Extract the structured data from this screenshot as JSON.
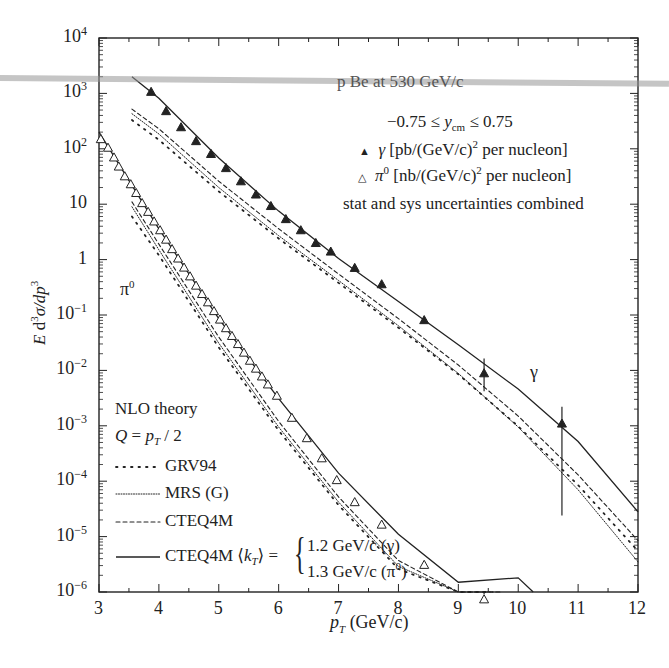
{
  "chart_data": {
    "type": "scatter",
    "title": "p Be at 530 GeV/c",
    "subtitle": "-0.75 ≤ y_cm ≤ 0.75",
    "xlabel": "p_T (GeV/c)",
    "ylabel": "E d³σ/dp³",
    "xlim": [
      3,
      12
    ],
    "ylim": [
      1e-06,
      10000.0
    ],
    "yscale": "log",
    "x_ticks": [
      "3",
      "4",
      "5",
      "6",
      "7",
      "8",
      "9",
      "10",
      "11",
      "12"
    ],
    "y_ticks": [
      "10^-6",
      "10^-5",
      "10^-4",
      "10^-3",
      "10^-2",
      "10^-1",
      "1",
      "10",
      "10^2",
      "10^3",
      "10^4"
    ],
    "grid": false,
    "legend": {
      "data_entries": [
        {
          "marker": "filled-triangle",
          "label": "γ [pb/(GeV/c)² per nucleon]"
        },
        {
          "marker": "open-triangle",
          "label": "π⁰ [nb/(GeV/c)² per nucleon]"
        }
      ],
      "note": "stat and sys uncertainties combined",
      "theory_header": "NLO theory",
      "theory_scale": "Q = p_T / 2",
      "theory_entries": [
        {
          "style": "dotted-sparse",
          "label": "GRV94"
        },
        {
          "style": "dotted-dense",
          "label": "MRS (G)"
        },
        {
          "style": "dashed",
          "label": "CTEQ4M"
        },
        {
          "style": "solid",
          "label": "CTEQ4M ⟨k_T⟩ = {1.2 GeV/c (γ), 1.3 GeV/c (π⁰)}"
        }
      ]
    },
    "annotations": [
      "γ",
      "π⁰"
    ],
    "series": [
      {
        "name": "gamma data",
        "marker": "filled-triangle",
        "x": [
          3.87,
          4.12,
          4.37,
          4.62,
          4.87,
          5.12,
          5.37,
          5.62,
          5.87,
          6.12,
          6.37,
          6.62,
          6.87,
          7.27,
          7.72,
          8.43,
          9.43,
          10.73
        ],
        "y": [
          1070,
          480,
          246,
          138,
          81,
          45,
          26,
          15,
          9.3,
          5.4,
          3.4,
          2.0,
          1.4,
          0.71,
          0.36,
          0.081,
          0.0089,
          0.0011
        ],
        "err_low": [
          null,
          null,
          null,
          null,
          null,
          null,
          null,
          null,
          null,
          null,
          null,
          null,
          null,
          null,
          null,
          null,
          0.0042,
          2.4e-05
        ],
        "err_high": [
          null,
          null,
          null,
          null,
          null,
          null,
          null,
          null,
          null,
          null,
          null,
          null,
          null,
          null,
          null,
          null,
          0.0164,
          0.0022
        ]
      },
      {
        "name": "pi0 data",
        "marker": "open-triangle",
        "x": [
          3.03,
          3.15,
          3.25,
          3.33,
          3.43,
          3.53,
          3.62,
          3.72,
          3.82,
          3.92,
          4.02,
          4.12,
          4.22,
          4.32,
          4.42,
          4.52,
          4.62,
          4.72,
          4.82,
          4.92,
          5.02,
          5.12,
          5.22,
          5.32,
          5.42,
          5.52,
          5.62,
          5.72,
          5.82,
          5.97,
          6.22,
          6.47,
          6.72,
          6.97,
          7.27,
          7.72,
          8.43,
          9.43
        ],
        "y": [
          150,
          105,
          70,
          48,
          32,
          23,
          16,
          10.5,
          7.3,
          4.9,
          3.4,
          2.3,
          1.55,
          1.05,
          0.72,
          0.5,
          0.34,
          0.24,
          0.17,
          0.118,
          0.083,
          0.058,
          0.042,
          0.03,
          0.021,
          0.015,
          0.0108,
          0.0078,
          0.0056,
          0.0035,
          0.0014,
          0.0006,
          0.00026,
          0.000105,
          4.2e-05,
          1.65e-05,
          3.1e-06,
          7.4e-07
        ],
        "err_low": [
          null,
          null,
          null,
          null,
          null,
          null,
          null,
          null,
          null,
          null,
          null,
          null,
          null,
          null,
          null,
          null,
          null,
          null,
          null,
          null,
          null,
          null,
          null,
          null,
          null,
          null,
          null,
          null,
          null,
          null,
          null,
          null,
          null,
          null,
          null,
          null,
          null,
          5.2e-07
        ],
        "err_high": [
          null,
          null,
          null,
          null,
          null,
          null,
          null,
          null,
          null,
          null,
          null,
          null,
          null,
          null,
          null,
          null,
          null,
          null,
          null,
          null,
          null,
          null,
          null,
          null,
          null,
          null,
          null,
          null,
          null,
          null,
          null,
          null,
          null,
          null,
          null,
          null,
          null,
          9.1e-07
        ]
      },
      {
        "name": "gamma CTEQ4M <kT>=1.2 (solid)",
        "x": [
          3.55,
          4,
          5,
          6,
          7,
          8,
          9,
          10,
          11,
          12
        ],
        "y": [
          2000,
          820,
          68,
          7.5,
          1.05,
          0.175,
          0.029,
          0.0046,
          0.00052,
          2.8e-05
        ]
      },
      {
        "name": "gamma CTEQ4M (dashed)",
        "x": [
          3.55,
          4,
          5,
          6,
          7,
          8,
          9,
          10,
          11,
          12
        ],
        "y": [
          520,
          230,
          26,
          3.6,
          0.55,
          0.086,
          0.0125,
          0.0015,
          0.00013,
          8.5e-06
        ]
      },
      {
        "name": "gamma MRS(G) (dotted-dense)",
        "x": [
          3.55,
          4,
          5,
          6,
          7,
          8,
          9,
          10,
          11,
          12
        ],
        "y": [
          430,
          185,
          20,
          2.7,
          0.42,
          0.064,
          0.0088,
          0.00095,
          7e-05,
          3.5e-06
        ]
      },
      {
        "name": "gamma GRV94 (dotted-sparse)",
        "x": [
          3.55,
          4,
          5,
          6,
          7,
          8,
          9,
          10,
          11,
          12
        ],
        "y": [
          330,
          145,
          17,
          2.4,
          0.38,
          0.059,
          0.0085,
          0.00098,
          8.5e-05,
          5.5e-06
        ]
      },
      {
        "name": "pi0 CTEQ4M <kT>=1.3 (solid)",
        "x": [
          3.0,
          4,
          5,
          6,
          7,
          8,
          9,
          10,
          10.25
        ],
        "y": [
          200,
          3.6,
          0.086,
          0.0031,
          0.00014,
          1.1e-05,
          1.5e-06,
          1.8e-06,
          1e-06
        ]
      },
      {
        "name": "pi0 CTEQ4M (dashed)",
        "x": [
          3.55,
          4,
          5,
          6,
          7,
          8,
          9,
          9.7
        ],
        "y": [
          11,
          1.9,
          0.04,
          0.0012,
          5.2e-05,
          3.7e-06,
          2.5e-07,
          1e-06
        ]
      },
      {
        "name": "pi0 MRS(G) (dotted-dense)",
        "x": [
          3.55,
          4,
          5,
          6,
          7,
          8,
          9,
          9.6
        ],
        "y": [
          9,
          1.5,
          0.031,
          0.00095,
          4.2e-05,
          2.9e-06,
          2.1e-07,
          1e-06
        ]
      },
      {
        "name": "pi0 GRV94 (dotted-sparse)",
        "x": [
          3.55,
          4,
          5,
          6,
          7,
          8,
          9,
          9.5
        ],
        "y": [
          6,
          1.2,
          0.026,
          0.00082,
          3.7e-05,
          2.6e-06,
          2e-07,
          1e-06
        ]
      }
    ]
  },
  "text": {
    "title": "p Be at 530 GeV/c",
    "rapidity": "−0.75 ≤ ",
    "rapidity_var": "y",
    "rapidity_sub": "cm",
    "rapidity_end": " ≤ 0.75",
    "gamma_legend_marker": "▲",
    "gamma_legend_sym": "γ",
    "gamma_legend_text_a": " [pb/(GeV/c)",
    "gamma_legend_sup": "2",
    "gamma_legend_text_b": " per nucleon]",
    "pi0_legend_marker": "△",
    "pi0_legend_sym": "π",
    "pi0_legend_sup0": "0",
    "pi0_legend_text_a": " [nb/(GeV/c)",
    "pi0_legend_sup": "2",
    "pi0_legend_text_b": " per nucleon]",
    "uncert_note": "stat and sys uncertainties combined",
    "gamma_annot": "γ",
    "pi0_annot": "π",
    "pi0_annot_sup": "0",
    "nlo_header": "NLO theory",
    "scale_a": "Q",
    "scale_b": " = ",
    "scale_c": "p",
    "scale_sub": "T",
    "scale_d": " / 2",
    "grv": "GRV94",
    "mrs": "MRS (G)",
    "cteq": "CTEQ4M",
    "cteq_kt": "CTEQ4M ⟨",
    "cteq_kt_var": "k",
    "cteq_kt_sub": "T",
    "cteq_kt_end": "⟩ =",
    "brace_line1": "1.2 GeV/c (γ)",
    "brace_line2a": "1.3 GeV/c (π",
    "brace_line2_sup": "0",
    "brace_line2b": ")",
    "xlabel_var": "p",
    "xlabel_sub": "T",
    "xlabel_unit": " (GeV/c)",
    "ylabel_a": "E",
    "ylabel_b": " d",
    "ylabel_sup1": "3",
    "ylabel_c": "σ/d",
    "ylabel_d": "p",
    "ylabel_sup2": "3"
  },
  "x_tick_labels": [
    "3",
    "4",
    "5",
    "6",
    "7",
    "8",
    "9",
    "10",
    "11",
    "12"
  ],
  "y_tick_labels": [
    {
      "base": "10",
      "exp": "4"
    },
    {
      "base": "10",
      "exp": "3"
    },
    {
      "base": "10",
      "exp": "2"
    },
    {
      "base": "10",
      "exp": ""
    },
    {
      "base": "1",
      "exp": ""
    },
    {
      "base": "10",
      "exp": "−1"
    },
    {
      "base": "10",
      "exp": "−2"
    },
    {
      "base": "10",
      "exp": "−3"
    },
    {
      "base": "10",
      "exp": "−4"
    },
    {
      "base": "10",
      "exp": "−5"
    },
    {
      "base": "10",
      "exp": "−6"
    }
  ],
  "colors": {
    "ink": "#222222",
    "overlay": "#999999",
    "background": "#ffffff"
  }
}
